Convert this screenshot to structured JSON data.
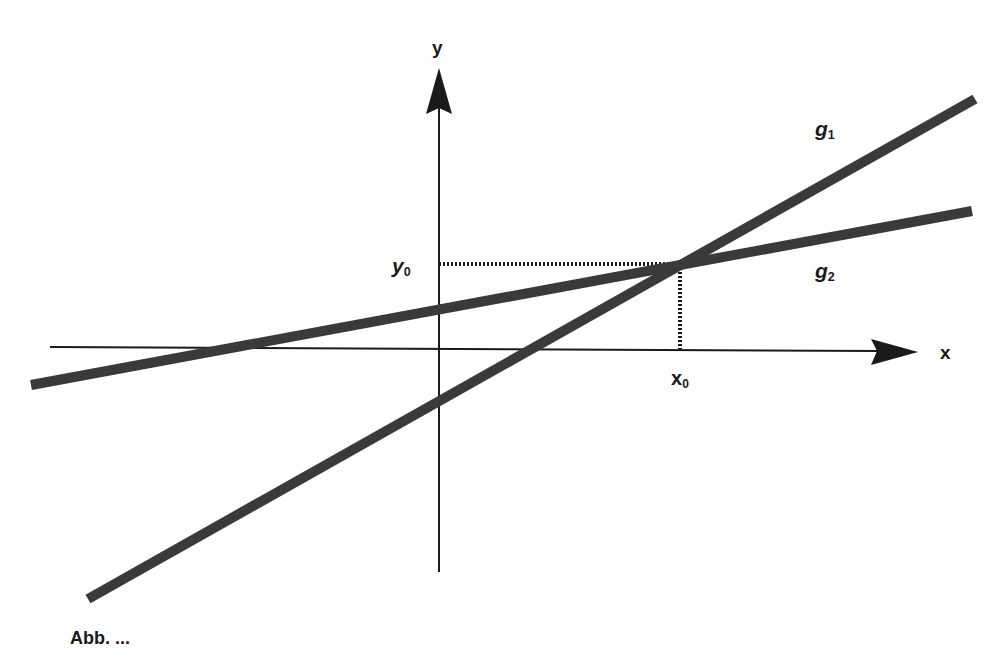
{
  "diagram": {
    "type": "linear-functions-intersection",
    "colors": {
      "lines": "#3a3a3a",
      "axes": "#1a1a1a",
      "background": "#ffffff"
    },
    "axes": {
      "x_label": "x",
      "y_label": "y"
    },
    "lines": [
      {
        "name": "g",
        "subscript": "1",
        "slope": "steeper"
      },
      {
        "name": "g",
        "subscript": "2",
        "slope": "shallower"
      }
    ],
    "intersection": {
      "x_label": "x",
      "x_subscript": "0",
      "y_label": "y",
      "y_subscript": "0"
    },
    "caption": "Abb. ..."
  }
}
